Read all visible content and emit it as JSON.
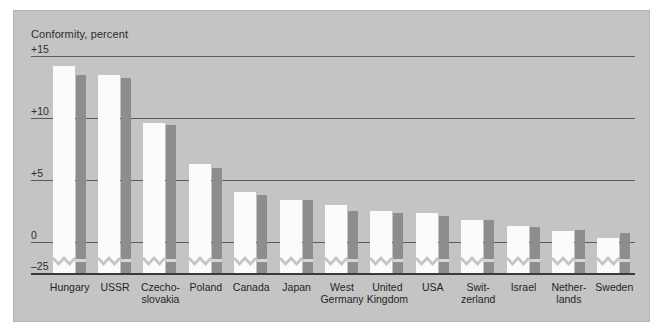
{
  "chart_data": {
    "type": "bar",
    "title": "Conformity, percent",
    "xlabel": "",
    "ylabel": "Conformity, percent",
    "ylim": [
      -25,
      15
    ],
    "ytick_labels": [
      "+15",
      "+10",
      "+5",
      "0",
      "–25"
    ],
    "ytick_values": [
      15,
      10,
      5,
      0,
      -25
    ],
    "grid": true,
    "axis_break": true,
    "legend_position": "none",
    "categories": [
      "Hungary",
      "USSR",
      "Czecho-\nslovakia",
      "Poland",
      "Canada",
      "Japan",
      "West\nGermany",
      "United\nKingdom",
      "USA",
      "Swit-\nzerland",
      "Israel",
      "Nether-\nlands",
      "Sweden"
    ],
    "series": [
      {
        "name": "series-light",
        "color": "#fbfbfb",
        "values": [
          14.2,
          13.5,
          9.6,
          6.3,
          4.0,
          3.4,
          3.0,
          2.5,
          2.3,
          1.8,
          1.3,
          0.9,
          0.3
        ]
      },
      {
        "name": "series-dark",
        "color": "#8d8d90",
        "values": [
          13.5,
          13.2,
          9.4,
          6.0,
          3.8,
          3.4,
          2.5,
          2.3,
          2.1,
          1.8,
          1.2,
          1.0,
          0.7
        ]
      }
    ]
  },
  "colors": {
    "panel_background": "#c4c4c4",
    "page_background": "#ffffff",
    "gridline": "#59595c",
    "baseline": "#3a3a3c",
    "bar_light": "#fbfbfb",
    "bar_dark": "#8d8d90",
    "text": "#242424"
  }
}
